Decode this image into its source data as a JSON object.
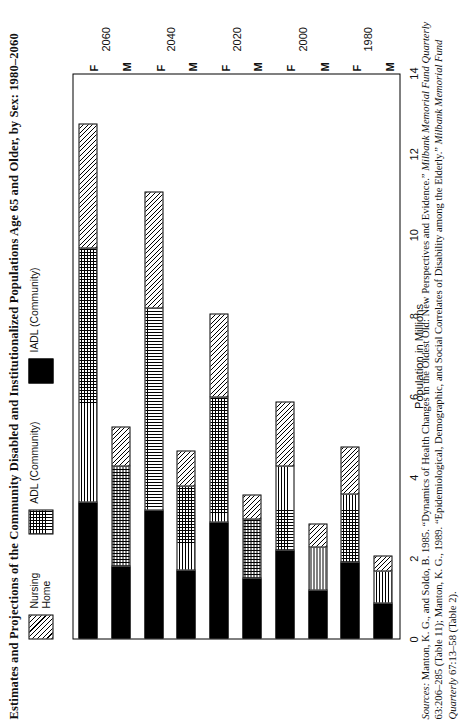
{
  "title": "Estimates and Projections of the Community Disabled and Institutionalized Populations Age 65 and Older, by Sex: 1980–2060",
  "legend": {
    "items": [
      {
        "label": "Nursing\nHome",
        "pattern": "diagonal-hatch",
        "color": "#000000"
      },
      {
        "label": "ADL  (Community)",
        "pattern": "cross-hatch",
        "color": "#000000"
      },
      {
        "label": "IADL (Community)",
        "pattern": "solid",
        "color": "#000000"
      }
    ]
  },
  "axes": {
    "ylabel": "Population in Millions",
    "yticks": [
      "0",
      "2",
      "4",
      "6",
      "8",
      "10",
      "12",
      "14"
    ],
    "ymin": 0,
    "ymax": 14
  },
  "sources": {
    "lead": "Sources:",
    "line1": " Manton, K. G., and Soldo, B. 1985. “Dynamics of Health Changes in the Oldest Old: New Perspectives and",
    "line2a": "Evidence.” ",
    "line2b": "Milbank Memorial Fund Quarterly",
    "line2c": " 63:206–285 (Table 11); Manton, K. G., 1989. “Epidemiological,",
    "line3a": "Demographic, and Social Correlates of Disability among the Elderly.” ",
    "line3b": "Milbank Memorial Fund Quarterly",
    "line3c": " 67:13–58",
    "line4": "(Table 2)."
  },
  "chart_data": {
    "type": "bar",
    "orientation": "horizontal",
    "title": "Estimates and Projections of the Community Disabled and Institutionalized Populations Age 65 and Older, by Sex: 1980–2060",
    "xlabel": "",
    "ylabel": "Population in Millions",
    "ylim": [
      0,
      14
    ],
    "grid": false,
    "legend_position": "top",
    "stacked": true,
    "categories": [
      "1980 M",
      "1980 F",
      "2000 M",
      "2000 F",
      "2020 M",
      "2020 F",
      "2040 M",
      "2040 F",
      "2060 M",
      "2060 F"
    ],
    "groups": [
      {
        "year": "1980",
        "sexes": [
          "M",
          "F"
        ]
      },
      {
        "year": "2000",
        "sexes": [
          "M",
          "F"
        ]
      },
      {
        "year": "2020",
        "sexes": [
          "M",
          "F"
        ]
      },
      {
        "year": "2040",
        "sexes": [
          "M",
          "F"
        ]
      },
      {
        "year": "2060",
        "sexes": [
          "M",
          "F"
        ]
      }
    ],
    "series": [
      {
        "name": "IADL (Community)",
        "values": [
          0.9,
          1.9,
          1.2,
          2.2,
          1.5,
          2.9,
          1.7,
          3.2,
          1.8,
          3.4
        ]
      },
      {
        "name": "ADL (Community)",
        "values": [
          0.8,
          1.7,
          1.1,
          2.1,
          1.5,
          3.1,
          2.1,
          5.0,
          2.5,
          6.3
        ]
      },
      {
        "name": "Nursing Home",
        "values": [
          0.4,
          1.2,
          0.6,
          1.6,
          0.6,
          2.1,
          0.9,
          2.9,
          1.0,
          3.1
        ]
      }
    ],
    "bars": [
      {
        "label": "M",
        "year": "1980",
        "segments": [
          {
            "name": "IADL (Community)",
            "start": 0.0,
            "end": 0.9
          },
          {
            "name": "ADL (Community)",
            "start": 0.9,
            "end": 1.7
          },
          {
            "name": "Nursing Home",
            "start": 1.7,
            "end": 2.1
          }
        ]
      },
      {
        "label": "F",
        "year": "1980",
        "segments": [
          {
            "name": "IADL (Community)",
            "start": 0.0,
            "end": 1.9
          },
          {
            "name": "ADL (Community)",
            "start": 1.9,
            "end": 3.6
          },
          {
            "name": "Nursing Home",
            "start": 3.6,
            "end": 4.8
          }
        ]
      },
      {
        "label": "M",
        "year": "2000",
        "segments": [
          {
            "name": "IADL (Community)",
            "start": 0.0,
            "end": 1.2
          },
          {
            "name": "ADL (Community)",
            "start": 1.2,
            "end": 2.3
          },
          {
            "name": "Nursing Home",
            "start": 2.3,
            "end": 2.9
          }
        ]
      },
      {
        "label": "F",
        "year": "2000",
        "segments": [
          {
            "name": "IADL (Community)",
            "start": 0.0,
            "end": 2.2
          },
          {
            "name": "ADL (Community)",
            "start": 2.2,
            "end": 4.3
          },
          {
            "name": "Nursing Home",
            "start": 4.3,
            "end": 5.9
          }
        ]
      },
      {
        "label": "M",
        "year": "2020",
        "segments": [
          {
            "name": "IADL (Community)",
            "start": 0.0,
            "end": 1.5
          },
          {
            "name": "ADL (Community)",
            "start": 1.5,
            "end": 3.0
          },
          {
            "name": "Nursing Home",
            "start": 3.0,
            "end": 3.6
          }
        ]
      },
      {
        "label": "F",
        "year": "2020",
        "segments": [
          {
            "name": "IADL (Community)",
            "start": 0.0,
            "end": 2.9
          },
          {
            "name": "ADL (Community)",
            "start": 2.9,
            "end": 6.0
          },
          {
            "name": "Nursing Home",
            "start": 6.0,
            "end": 8.1
          }
        ]
      },
      {
        "label": "M",
        "year": "2040",
        "segments": [
          {
            "name": "IADL (Community)",
            "start": 0.0,
            "end": 1.7
          },
          {
            "name": "ADL (Community)",
            "start": 1.7,
            "end": 3.8
          },
          {
            "name": "Nursing Home",
            "start": 3.8,
            "end": 4.7
          }
        ]
      },
      {
        "label": "F",
        "year": "2040",
        "segments": [
          {
            "name": "IADL (Community)",
            "start": 0.0,
            "end": 3.2
          },
          {
            "name": "ADL (Community)",
            "start": 3.2,
            "end": 8.2
          },
          {
            "name": "Nursing Home",
            "start": 8.2,
            "end": 11.1
          }
        ]
      },
      {
        "label": "M",
        "year": "2060",
        "segments": [
          {
            "name": "IADL (Community)",
            "start": 0.0,
            "end": 1.8
          },
          {
            "name": "ADL (Community)",
            "start": 1.8,
            "end": 4.3
          },
          {
            "name": "Nursing Home",
            "start": 4.3,
            "end": 5.3
          }
        ]
      },
      {
        "label": "F",
        "year": "2060",
        "segments": [
          {
            "name": "IADL (Community)",
            "start": 0.0,
            "end": 3.4
          },
          {
            "name": "ADL (Community)",
            "start": 3.4,
            "end": 9.7
          },
          {
            "name": "Nursing Home",
            "start": 9.7,
            "end": 12.8
          }
        ]
      }
    ]
  }
}
